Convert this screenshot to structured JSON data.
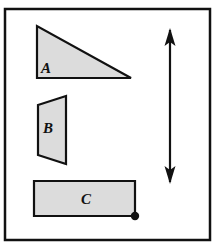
{
  "figure": {
    "background_color": "#ffffff",
    "frame": {
      "name": "outer-frame",
      "x": 5,
      "y": 9,
      "width": 205,
      "height": 231,
      "stroke_color": "#111111",
      "stroke_width": 2.5,
      "fill": "#ffffff"
    },
    "shape_fill_color": "#dcdcdc",
    "shape_stroke_color": "#111111",
    "shape_stroke_width": 2.2,
    "shapes": [
      {
        "id": "A",
        "name": "triangle-a",
        "type": "right-triangle",
        "label": "A",
        "label_x": 46,
        "label_y": 73,
        "points": "37,26 37,78 131,78",
        "description": "Right triangle, right angle at lower-left, hypotenuse from top-left to lower-right"
      },
      {
        "id": "B",
        "name": "quadrilateral-b",
        "type": "trapezoid",
        "label": "B",
        "label_x": 45,
        "label_y": 133,
        "points": "66,96 38,105 38,155 66,164",
        "description": "Quadrilateral with vertical right edge and slanted left edge"
      },
      {
        "id": "C",
        "name": "rectangle-c",
        "type": "rectangle",
        "label": "C",
        "label_x": 86,
        "label_y": 204,
        "points": "34,181 135,181 135,216 34,216",
        "description": "Horizontal rectangle"
      }
    ],
    "point_marker": {
      "name": "vertex-dot",
      "cx": 135,
      "cy": 216,
      "r": 4.2,
      "color": "#111111",
      "description": "Filled dot at bottom-right corner of rectangle C"
    },
    "arrow": {
      "name": "double-headed-vertical-arrow",
      "x": 170,
      "y_top": 28,
      "y_bottom": 184,
      "color": "#111111",
      "shaft_width": 2.2,
      "head_half_width": 5.5,
      "head_length": 16,
      "description": "Vertical double-headed arrow at right side"
    }
  }
}
